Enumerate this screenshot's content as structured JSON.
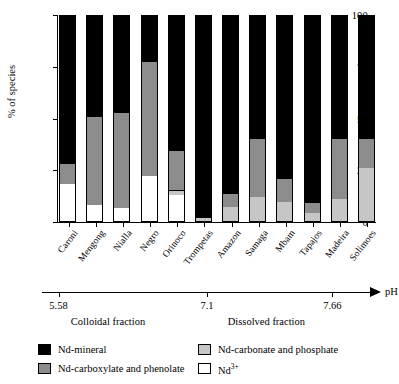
{
  "chart_data": {
    "type": "bar",
    "subtype": "stacked-bar-100-percent",
    "title": "",
    "xlabel": "pH",
    "ylabel": "% of species",
    "ylim": [
      0,
      100
    ],
    "yticks": [
      0,
      25,
      50,
      75,
      100
    ],
    "ytick_labels": [
      "0",
      "25",
      "50",
      "75",
      "100"
    ],
    "grid": false,
    "legend_position": "below-plot",
    "categories": [
      "Caroni",
      "Mengong",
      "Nialla",
      "Negro",
      "Orinoco",
      "Trompetas",
      "Amazon",
      "Samaga",
      "Mbam",
      "Tapajos",
      "Madeira",
      "Solimoes"
    ],
    "series": [
      {
        "name": "Nd3+",
        "legend_label": "Nd3+",
        "color": "#ffffff",
        "fraction": "Dissolved fraction",
        "values": [
          18,
          8,
          6.5,
          22,
          13,
          0,
          0,
          0,
          0,
          0,
          0,
          0
        ]
      },
      {
        "name": "Nd-carbonate and phosphate",
        "legend_label": "Nd-carbonate and phosphate",
        "color": "#c6c6c6",
        "fraction": "Dissolved fraction",
        "values": [
          0,
          0,
          0,
          0,
          2,
          1.5,
          7,
          12,
          9.5,
          4,
          11,
          26
        ]
      },
      {
        "name": "Nd-carboxylate and phenolate",
        "legend_label": "Nd-carboxylate and phenolate",
        "color": "#8c8c8c",
        "fraction": "Colloidal fraction",
        "values": [
          10,
          43,
          46.5,
          56,
          19,
          0,
          6,
          28,
          11,
          5,
          29,
          14
        ]
      },
      {
        "name": "Nd-mineral",
        "legend_label": "Nd-mineral",
        "color": "#000000",
        "fraction": "Colloidal fraction",
        "values": [
          72,
          49,
          47,
          22,
          66,
          98.5,
          87,
          60,
          79.5,
          91,
          60,
          60
        ]
      }
    ],
    "ph_axis": {
      "label": "pH",
      "ticks": [
        {
          "value": "5.58",
          "position": 0.05
        },
        {
          "value": "7.1",
          "position": 0.5
        },
        {
          "value": "7.66",
          "position": 0.88
        }
      ],
      "fraction_labels": [
        {
          "text": "Colloidal fraction",
          "position": 0.2
        },
        {
          "text": "Dissolved fraction",
          "position": 0.68
        }
      ]
    }
  },
  "axes": {
    "ylabel": "% of species",
    "ytick_labels": [
      "100",
      "75",
      "50",
      "25",
      "0"
    ],
    "ytick_values": [
      100,
      75,
      50,
      25,
      0
    ]
  },
  "ph": {
    "name": "pH",
    "tick_labels": [
      "5.58",
      "7.1",
      "7.66"
    ],
    "fraction_left": "Colloidal fraction",
    "fraction_right": "Dissolved fraction"
  },
  "legend": {
    "items": [
      {
        "label": "Nd-mineral",
        "swatch": "black-swatch"
      },
      {
        "label": "Nd-carbonate and phosphate",
        "swatch": "light-gray-swatch"
      },
      {
        "label": "Nd-carboxylate and phenolate",
        "swatch": "dark-gray-swatch"
      },
      {
        "label": "Nd3+",
        "swatch": "white-swatch"
      }
    ]
  }
}
